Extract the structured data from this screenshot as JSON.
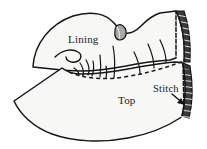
{
  "figure": {
    "background_color": "#ffffff",
    "ink_color": "#151515",
    "fabric_fill": "#f7f7f5",
    "shade_fill": "#a8a8a6",
    "fold_edge_fill": "#2b2b2b",
    "labels": [
      {
        "id": "lining",
        "text": "Lining",
        "x": 68,
        "y": 43,
        "anchor": "start",
        "size": "normal"
      },
      {
        "id": "top",
        "text": "Top",
        "x": 118,
        "y": 104,
        "anchor": "start",
        "size": "normal"
      },
      {
        "id": "stitch",
        "text": "Stitch",
        "x": 153,
        "y": 92,
        "anchor": "start",
        "size": "small"
      }
    ],
    "parts": {
      "lining_piece": "Upper lining panel, curved dome shape, left point",
      "top_piece": "Vamp / top panel, wide lower shape with wavy hem",
      "seam": "Dashed stitch line joining top to lining",
      "basting_threads": "Short hand basting thread strokes crossing the seam",
      "fold_flap": "Folded back edge at right with hatched shading",
      "tongue_tab": "Small gray shaded tab near top center"
    },
    "annotation": {
      "arrow_name": "stitch-callout-arrow",
      "arrow_from": [
        174,
        96
      ],
      "arrow_to": [
        186,
        105
      ]
    }
  }
}
